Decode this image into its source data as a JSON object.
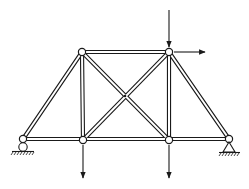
{
  "diagram": {
    "type": "truss",
    "colors": {
      "line": "#1a1a1a",
      "fill": "#ffffff",
      "background": "#ffffff"
    },
    "nodes": [
      {
        "id": "A",
        "x": 23,
        "y": 139,
        "support": "roller"
      },
      {
        "id": "B",
        "x": 83,
        "y": 140
      },
      {
        "id": "C",
        "x": 169,
        "y": 140
      },
      {
        "id": "D",
        "x": 229,
        "y": 139,
        "support": "pin"
      },
      {
        "id": "E",
        "x": 82,
        "y": 52
      },
      {
        "id": "F",
        "x": 169,
        "y": 52
      }
    ],
    "members": [
      [
        "A",
        "B"
      ],
      [
        "B",
        "C"
      ],
      [
        "C",
        "D"
      ],
      [
        "E",
        "F"
      ],
      [
        "A",
        "E"
      ],
      [
        "F",
        "D"
      ],
      [
        "E",
        "B"
      ],
      [
        "F",
        "C"
      ],
      [
        "E",
        "C"
      ],
      [
        "B",
        "F"
      ]
    ],
    "loads": [
      {
        "node": "F",
        "direction": "down",
        "label": "vertical load at top-right joint"
      },
      {
        "node": "F",
        "direction": "right",
        "label": "horizontal load at top-right joint"
      },
      {
        "node": "B",
        "direction": "down",
        "label": "load at bottom joint B"
      },
      {
        "node": "C",
        "direction": "down",
        "label": "load at bottom joint C"
      }
    ]
  }
}
